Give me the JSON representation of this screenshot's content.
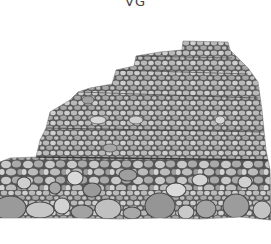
{
  "image": {
    "subject": "Illustration of a terraced stepped stone wall built of rounded cobblestones",
    "caption_fragment": "VG",
    "colors": {
      "background": "#ffffff",
      "stone_light": "#d9d9d9",
      "stone_mid": "#b8b8b8",
      "stone_dark": "#8f8f8f",
      "mortar_outline": "#4a4a4a"
    },
    "tiers": 5
  }
}
